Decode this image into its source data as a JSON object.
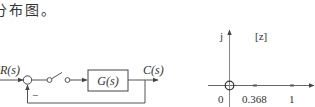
{
  "caption": {
    "text": "分布图。"
  },
  "block_diagram": {
    "input_label": "R(s)",
    "output_label": "C(s)",
    "block_label": "G(s)",
    "feedback_sign": "−",
    "components": [
      "summing-junction",
      "sampler-switch",
      "transfer-block",
      "unity-feedback"
    ]
  },
  "z_plane": {
    "plane_label": "[z]",
    "imag_axis_label": "j",
    "origin_label": "0",
    "ticks": [
      {
        "label": "0.368",
        "value": 0.368,
        "marker": "x"
      },
      {
        "label": "1",
        "value": 1,
        "marker": "x"
      }
    ],
    "zero_at_origin": true
  },
  "colors": {
    "line": "#555555",
    "text": "#333333",
    "background": "#ffffff"
  }
}
